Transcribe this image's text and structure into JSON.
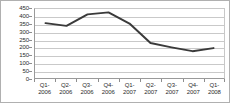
{
  "chart_data": {
    "type": "line",
    "title": "",
    "subtitle": "",
    "xlabel": "",
    "ylabel": "",
    "categories": [
      "Q1-2006",
      "Q2-2006",
      "Q3-2006",
      "Q4-2006",
      "Q1-2007",
      "Q2-2007",
      "Q3-2007",
      "Q4-2007",
      "Q1-2008"
    ],
    "category_lines": [
      [
        "Q1-",
        "2006"
      ],
      [
        "Q2-",
        "2006"
      ],
      [
        "Q3-",
        "2006"
      ],
      [
        "Q4-",
        "2006"
      ],
      [
        "Q1-",
        "2007"
      ],
      [
        "Q2-",
        "2007"
      ],
      [
        "Q3-",
        "2007"
      ],
      [
        "Q4-",
        "2007"
      ],
      [
        "Q1-",
        "2008"
      ]
    ],
    "values": [
      358,
      340,
      415,
      428,
      355,
      228,
      200,
      175,
      195
    ],
    "series": [
      {
        "name": "",
        "values": [
          358,
          340,
          415,
          428,
          355,
          228,
          200,
          175,
          195
        ],
        "color": "#3a3a3a"
      }
    ],
    "ylim": [
      0,
      450
    ],
    "ytick_step": 50,
    "yticks": [
      0,
      50,
      100,
      150,
      200,
      250,
      300,
      350,
      400,
      450
    ],
    "ytick_labels": [
      "0",
      "50",
      "100",
      "150",
      "200",
      "250",
      "300",
      "350",
      "400",
      "450"
    ],
    "grid": true,
    "grid_color": "#c9c9c9",
    "legend": false,
    "legend_position": "none",
    "line_color": "#3a3a3a",
    "line_width": 2,
    "markers": false,
    "plot_background": "#ffffff",
    "border_color": "#b0b0b0"
  }
}
